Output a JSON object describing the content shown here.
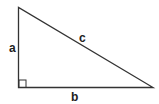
{
  "diagram": {
    "type": "right-triangle",
    "stroke_color": "#333333",
    "labels": {
      "a": "a",
      "b": "b",
      "c": "c"
    },
    "right_angle_marker": true
  }
}
